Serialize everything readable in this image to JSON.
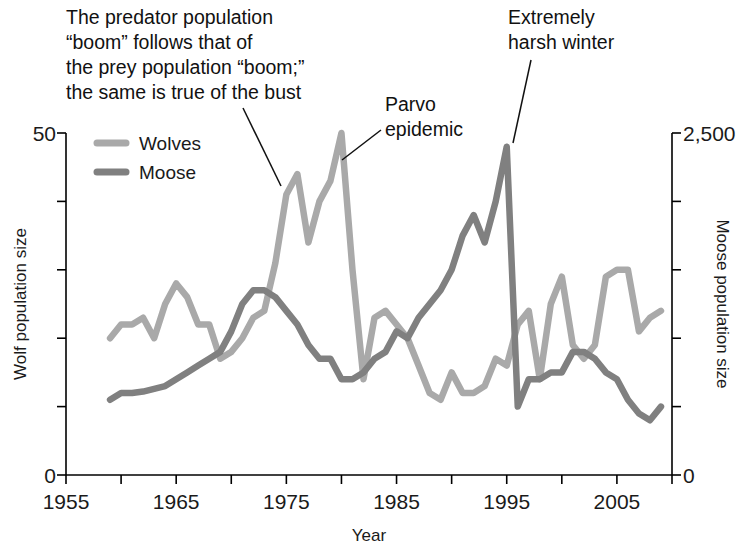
{
  "chart_data": {
    "type": "line",
    "title": "",
    "xlabel": "Year",
    "ylabel": "Wolf population size",
    "y2label": "Moose population size",
    "xlim": [
      1955,
      2010
    ],
    "ylim": [
      0,
      50
    ],
    "y2lim": [
      0,
      2500
    ],
    "grid": false,
    "legend_position": "top-left",
    "x_ticks_major": [
      1955,
      1965,
      1975,
      1985,
      1995,
      2005
    ],
    "x_tick_labels": [
      "1955",
      "1965",
      "1975",
      "1985",
      "1995",
      "2005"
    ],
    "x_ticks_minor": [
      1960,
      1970,
      1980,
      1990,
      2000,
      2010
    ],
    "y_ticks": [
      0,
      10,
      20,
      30,
      40,
      50
    ],
    "y_tick_labels": [
      "0",
      "",
      "",
      "",
      "",
      "50"
    ],
    "y2_ticks": [
      0,
      500,
      1000,
      1500,
      2000,
      2500
    ],
    "y2_tick_labels": [
      "0",
      "",
      "",
      "",
      "",
      "2,500"
    ],
    "x": [
      1959,
      1960,
      1961,
      1962,
      1963,
      1964,
      1965,
      1966,
      1967,
      1968,
      1969,
      1970,
      1971,
      1972,
      1973,
      1974,
      1975,
      1976,
      1977,
      1978,
      1979,
      1980,
      1981,
      1982,
      1983,
      1984,
      1985,
      1986,
      1987,
      1988,
      1989,
      1990,
      1991,
      1992,
      1993,
      1994,
      1995,
      1996,
      1997,
      1998,
      1999,
      2000,
      2001,
      2002,
      2003,
      2004,
      2005,
      2006,
      2007,
      2008,
      2009
    ],
    "series": [
      {
        "name": "Wolves",
        "axis": "left",
        "color": "#a9a9a9",
        "values": [
          20,
          22,
          22,
          23,
          20,
          25,
          28,
          26,
          22,
          22,
          17,
          18,
          20,
          23,
          24,
          31,
          41,
          44,
          34,
          40,
          43,
          50,
          30,
          14,
          23,
          24,
          22,
          20,
          16,
          12,
          11,
          15,
          12,
          12,
          13,
          17,
          16,
          22,
          24,
          14,
          25,
          29,
          19,
          17,
          19,
          29,
          30,
          30,
          21,
          23,
          24
        ]
      },
      {
        "name": "Moose",
        "axis": "right",
        "color": "#808080",
        "values": [
          550,
          600,
          600,
          610,
          630,
          650,
          700,
          750,
          800,
          850,
          900,
          1050,
          1250,
          1350,
          1350,
          1300,
          1200,
          1100,
          950,
          850,
          850,
          700,
          700,
          750,
          850,
          900,
          1050,
          1000,
          1150,
          1250,
          1350,
          1500,
          1750,
          1900,
          1700,
          2000,
          2400,
          500,
          700,
          700,
          750,
          750,
          900,
          900,
          850,
          750,
          700,
          550,
          450,
          400,
          500
        ]
      }
    ],
    "annotations": [
      {
        "id": "predator-boom-note",
        "lines": [
          "The predator population",
          "“boom” follows that of",
          "the prey population “boom;”",
          "the same is true of the bust"
        ],
        "leader": true
      },
      {
        "id": "parvo-epidemic-note",
        "lines": [
          "Parvo",
          "epidemic"
        ],
        "leader": true
      },
      {
        "id": "harsh-winter-note",
        "lines": [
          "Extremely",
          "harsh winter"
        ],
        "leader": true
      }
    ]
  },
  "legend": {
    "items": [
      {
        "label": "Wolves",
        "color": "#a9a9a9"
      },
      {
        "label": "Moose",
        "color": "#808080"
      }
    ]
  },
  "axes": {
    "left_title": "Wolf population size",
    "right_title": "Moose population size",
    "bottom_title": "Year",
    "left_top_label": "50",
    "left_bottom_label": "0",
    "right_top_label": "2,500",
    "right_bottom_label": "0",
    "x_labels": [
      "1955",
      "1965",
      "1975",
      "1985",
      "1995",
      "2005"
    ]
  },
  "annotations": {
    "boom_note_line1": "The predator population",
    "boom_note_line2": "“boom” follows that of",
    "boom_note_line3": "the prey population “boom;”",
    "boom_note_line4": "the same is true of the bust",
    "parvo_line1": "Parvo",
    "parvo_line2": "epidemic",
    "winter_line1": "Extremely",
    "winter_line2": "harsh winter"
  }
}
